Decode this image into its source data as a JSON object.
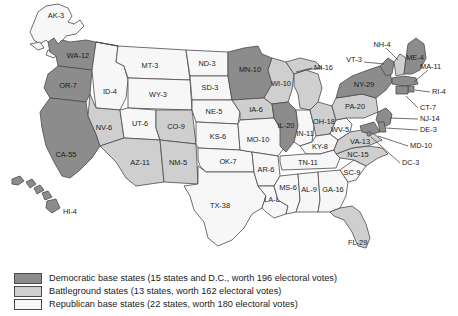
{
  "colors": {
    "democratic": "#8c8c8c",
    "battleground": "#cfcfcf",
    "republican": "#f7f7f7",
    "border": "#4a4a4a",
    "text": "#1a1a1a",
    "background": "#ffffff"
  },
  "legend": {
    "items": [
      {
        "key": "democratic",
        "swatch": "dem",
        "text": "Democratic base states (15 states and D.C., worth 196 electoral votes)"
      },
      {
        "key": "battleground",
        "swatch": "bat",
        "text": "Battleground states (13 states, worth 162 electoral votes)"
      },
      {
        "key": "republican",
        "swatch": "rep",
        "text": "Republican base states (22 states, worth 180 electoral votes)"
      }
    ]
  },
  "totals": {
    "democratic_states": 15,
    "democratic_votes": 196,
    "battleground_states": 13,
    "battleground_votes": 162,
    "republican_states": 22,
    "republican_votes": 180
  },
  "states": [
    {
      "code": "AK",
      "votes": 3,
      "label": "AK-3",
      "cat": "rep"
    },
    {
      "code": "HI",
      "votes": 4,
      "label": "HI-4",
      "cat": "dem"
    },
    {
      "code": "WA",
      "votes": 12,
      "label": "WA-12",
      "cat": "dem"
    },
    {
      "code": "OR",
      "votes": 7,
      "label": "OR-7",
      "cat": "dem"
    },
    {
      "code": "CA",
      "votes": 55,
      "label": "CA-55",
      "cat": "dem"
    },
    {
      "code": "ID",
      "votes": 4,
      "label": "ID-4",
      "cat": "rep"
    },
    {
      "code": "NV",
      "votes": 6,
      "label": "NV-6",
      "cat": "bat"
    },
    {
      "code": "MT",
      "votes": 3,
      "label": "MT-3",
      "cat": "rep"
    },
    {
      "code": "WY",
      "votes": 3,
      "label": "WY-3",
      "cat": "rep"
    },
    {
      "code": "UT",
      "votes": 6,
      "label": "UT-6",
      "cat": "rep"
    },
    {
      "code": "AZ",
      "votes": 11,
      "label": "AZ-11",
      "cat": "bat"
    },
    {
      "code": "CO",
      "votes": 9,
      "label": "CO-9",
      "cat": "bat"
    },
    {
      "code": "NM",
      "votes": 5,
      "label": "NM-5",
      "cat": "bat"
    },
    {
      "code": "ND",
      "votes": 3,
      "label": "ND-3",
      "cat": "rep"
    },
    {
      "code": "SD",
      "votes": 3,
      "label": "SD-3",
      "cat": "rep"
    },
    {
      "code": "NE",
      "votes": 5,
      "label": "NE-5",
      "cat": "rep"
    },
    {
      "code": "KS",
      "votes": 6,
      "label": "KS-6",
      "cat": "rep"
    },
    {
      "code": "OK",
      "votes": 7,
      "label": "OK-7",
      "cat": "rep"
    },
    {
      "code": "TX",
      "votes": 38,
      "label": "TX-38",
      "cat": "rep"
    },
    {
      "code": "MN",
      "votes": 10,
      "label": "MN-10",
      "cat": "dem"
    },
    {
      "code": "IA",
      "votes": 6,
      "label": "IA-6",
      "cat": "bat"
    },
    {
      "code": "MO",
      "votes": 10,
      "label": "MO-10",
      "cat": "rep"
    },
    {
      "code": "AR",
      "votes": 6,
      "label": "AR-6",
      "cat": "rep"
    },
    {
      "code": "LA",
      "votes": 8,
      "label": "LA-8",
      "cat": "rep"
    },
    {
      "code": "WI",
      "votes": 10,
      "label": "WI-10",
      "cat": "bat"
    },
    {
      "code": "IL",
      "votes": 20,
      "label": "IL-20",
      "cat": "dem"
    },
    {
      "code": "MI",
      "votes": 16,
      "label": "MI-16",
      "cat": "bat"
    },
    {
      "code": "IN",
      "votes": 11,
      "label": "IN-11",
      "cat": "rep"
    },
    {
      "code": "OH",
      "votes": 18,
      "label": "OH-18",
      "cat": "bat"
    },
    {
      "code": "KY",
      "votes": 8,
      "label": "KY-8",
      "cat": "rep"
    },
    {
      "code": "TN",
      "votes": 11,
      "label": "TN-11",
      "cat": "rep"
    },
    {
      "code": "MS",
      "votes": 6,
      "label": "MS-6",
      "cat": "rep"
    },
    {
      "code": "AL",
      "votes": 9,
      "label": "AL-9",
      "cat": "rep"
    },
    {
      "code": "GA",
      "votes": 16,
      "label": "GA-16",
      "cat": "rep"
    },
    {
      "code": "SC",
      "votes": 9,
      "label": "SC-9",
      "cat": "rep"
    },
    {
      "code": "NC",
      "votes": 15,
      "label": "NC-15",
      "cat": "bat"
    },
    {
      "code": "FL",
      "votes": 29,
      "label": "FL-29",
      "cat": "bat"
    },
    {
      "code": "VA",
      "votes": 13,
      "label": "VA-13",
      "cat": "bat"
    },
    {
      "code": "WV",
      "votes": 5,
      "label": "WV-5",
      "cat": "rep"
    },
    {
      "code": "PA",
      "votes": 20,
      "label": "PA-20",
      "cat": "bat"
    },
    {
      "code": "NY",
      "votes": 29,
      "label": "NY-29",
      "cat": "dem"
    },
    {
      "code": "VT",
      "votes": 3,
      "label": "VT-3",
      "cat": "dem"
    },
    {
      "code": "NH",
      "votes": 4,
      "label": "NH-4",
      "cat": "bat"
    },
    {
      "code": "ME",
      "votes": 4,
      "label": "ME-4",
      "cat": "dem"
    },
    {
      "code": "MA",
      "votes": 11,
      "label": "MA-11",
      "cat": "dem"
    },
    {
      "code": "RI",
      "votes": 4,
      "label": "RI-4",
      "cat": "dem"
    },
    {
      "code": "CT",
      "votes": 7,
      "label": "CT-7",
      "cat": "dem"
    },
    {
      "code": "NJ",
      "votes": 14,
      "label": "NJ-14",
      "cat": "dem"
    },
    {
      "code": "DE",
      "votes": 3,
      "label": "DE-3",
      "cat": "dem"
    },
    {
      "code": "MD",
      "votes": 10,
      "label": "MD-10",
      "cat": "dem"
    },
    {
      "code": "DC",
      "votes": 3,
      "label": "DC-3",
      "cat": "dem"
    }
  ]
}
